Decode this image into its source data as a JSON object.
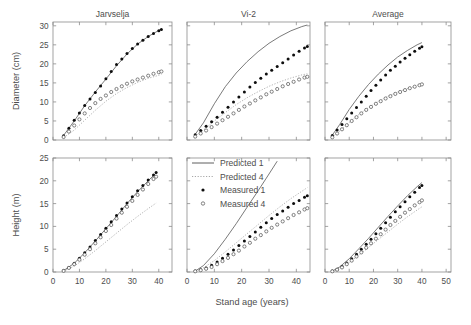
{
  "figure": {
    "xlabel": "Stand age (years)",
    "ylabel_top": "Diameter (cm)",
    "ylabel_bottom": "Height (m)"
  },
  "legend": {
    "items": [
      {
        "label": "Predicted 1",
        "key": "solid-line",
        "color": "#555555"
      },
      {
        "label": "Predicted 4",
        "key": "dotted-line",
        "color": "#999999"
      },
      {
        "label": "Measured 1",
        "key": "filled-circle",
        "color": "#111111"
      },
      {
        "label": "Measured 4",
        "key": "open-circle",
        "color": "#666666"
      }
    ]
  },
  "chart_data": [
    {
      "type": "line",
      "panel": "top-left",
      "title": "Jarvselja",
      "xlabel": "Stand age (years)",
      "ylabel": "Diameter (cm)",
      "xlim": [
        0,
        45
      ],
      "ylim": [
        0,
        31
      ],
      "xticks": [
        0,
        10,
        20,
        30,
        40
      ],
      "yticks": [
        0,
        5,
        10,
        15,
        20,
        25,
        30
      ],
      "grid": false,
      "series": [
        {
          "name": "Predicted 1",
          "style": "solid",
          "x": [
            4,
            8,
            12,
            16,
            20,
            24,
            28,
            32,
            36,
            40,
            41
          ],
          "y": [
            1.2,
            5.0,
            9.0,
            12.6,
            16.0,
            19.5,
            22.6,
            25.2,
            27.2,
            28.8,
            29.2
          ]
        },
        {
          "name": "Predicted 4",
          "style": "dotted",
          "x": [
            4,
            8,
            12,
            16,
            20,
            24,
            28,
            32,
            36,
            40,
            41
          ],
          "y": [
            0.6,
            2.6,
            5.2,
            7.8,
            10.2,
            12.2,
            13.8,
            15.1,
            16.2,
            17.0,
            17.2
          ]
        },
        {
          "name": "Measured 1",
          "style": "filled-dots",
          "x": [
            4,
            6,
            8,
            10,
            12,
            14,
            16,
            18,
            20,
            22,
            24,
            26,
            28,
            30,
            32,
            34,
            36,
            38,
            40,
            41
          ],
          "y": [
            1.1,
            3.1,
            5.2,
            7.1,
            9.1,
            10.8,
            12.5,
            14.2,
            16.1,
            18.0,
            19.8,
            21.3,
            22.7,
            24.0,
            25.2,
            26.2,
            27.2,
            28.0,
            28.7,
            29.0
          ]
        },
        {
          "name": "Measured 4",
          "style": "open-dots",
          "x": [
            4,
            6,
            8,
            10,
            12,
            14,
            16,
            18,
            20,
            22,
            24,
            26,
            28,
            30,
            32,
            34,
            36,
            38,
            40,
            41
          ],
          "y": [
            0.8,
            2.2,
            3.8,
            5.4,
            7.0,
            8.4,
            9.7,
            10.8,
            11.7,
            12.6,
            13.4,
            14.1,
            14.8,
            15.4,
            15.9,
            16.4,
            16.9,
            17.4,
            17.8,
            18.0
          ]
        }
      ]
    },
    {
      "type": "line",
      "panel": "top-middle",
      "title": "Vi-2",
      "xlabel": "Stand age (years)",
      "ylabel": "Diameter (cm)",
      "xlim": [
        0,
        45
      ],
      "ylim": [
        0,
        31
      ],
      "xticks": [
        0,
        10,
        20,
        30,
        40
      ],
      "yticks": [
        0,
        5,
        10,
        15,
        20,
        25,
        30
      ],
      "grid": false,
      "series": [
        {
          "name": "Predicted 1",
          "style": "solid",
          "x": [
            3,
            6,
            10,
            14,
            18,
            22,
            26,
            30,
            34,
            38,
            42,
            44
          ],
          "y": [
            1.5,
            4.5,
            9.5,
            14.0,
            17.6,
            20.6,
            23.2,
            25.4,
            27.2,
            28.7,
            29.8,
            30.2
          ]
        },
        {
          "name": "Predicted 4",
          "style": "dotted",
          "x": [
            3,
            6,
            10,
            14,
            18,
            22,
            26,
            30,
            34,
            38,
            42,
            44
          ],
          "y": [
            1.0,
            2.6,
            5.0,
            7.2,
            9.3,
            11.1,
            12.7,
            14.1,
            15.3,
            16.3,
            17.1,
            17.4
          ]
        },
        {
          "name": "Measured 1",
          "style": "filled-dots",
          "x": [
            3,
            5,
            7,
            9,
            11,
            13,
            15,
            17,
            19,
            21,
            23,
            25,
            27,
            29,
            31,
            33,
            35,
            37,
            39,
            41,
            43,
            44
          ],
          "y": [
            1.4,
            2.5,
            3.6,
            4.8,
            6.0,
            7.3,
            8.6,
            10.0,
            11.3,
            12.6,
            13.9,
            15.1,
            16.2,
            17.3,
            18.3,
            19.3,
            20.3,
            21.3,
            22.3,
            23.3,
            24.2,
            24.6
          ]
        },
        {
          "name": "Measured 4",
          "style": "open-dots",
          "x": [
            3,
            5,
            7,
            9,
            11,
            13,
            15,
            17,
            19,
            21,
            23,
            25,
            27,
            29,
            31,
            33,
            35,
            37,
            39,
            41,
            43,
            44
          ],
          "y": [
            0.9,
            1.7,
            2.5,
            3.4,
            4.3,
            5.2,
            6.1,
            7.0,
            7.9,
            8.8,
            9.6,
            10.4,
            11.2,
            12.0,
            12.7,
            13.4,
            14.1,
            14.7,
            15.3,
            15.9,
            16.4,
            16.6
          ]
        }
      ]
    },
    {
      "type": "line",
      "panel": "top-right",
      "title": "Average",
      "xlabel": "Stand age (years)",
      "ylabel": "Diameter (cm)",
      "xlim": [
        0,
        52
      ],
      "ylim": [
        0,
        31
      ],
      "xticks": [
        0,
        10,
        20,
        30,
        40,
        50
      ],
      "yticks": [
        0,
        5,
        10,
        15,
        20,
        25,
        30
      ],
      "grid": false,
      "series": [
        {
          "name": "Predicted 1",
          "style": "solid",
          "x": [
            3,
            6,
            10,
            14,
            18,
            22,
            26,
            30,
            34,
            38,
            40
          ],
          "y": [
            1.3,
            4.0,
            8.0,
            11.5,
            14.6,
            17.3,
            19.7,
            21.8,
            23.5,
            25.0,
            25.6
          ]
        },
        {
          "name": "Predicted 4",
          "style": "dotted",
          "x": [
            3,
            6,
            10,
            14,
            18,
            22,
            26,
            30,
            34,
            38,
            40
          ],
          "y": [
            0.8,
            2.3,
            4.6,
            6.7,
            8.5,
            10.1,
            11.5,
            12.6,
            13.5,
            14.3,
            14.6
          ]
        },
        {
          "name": "Measured 1",
          "style": "filled-dots",
          "x": [
            3,
            5,
            7,
            9,
            11,
            13,
            15,
            17,
            19,
            21,
            23,
            25,
            27,
            29,
            31,
            33,
            35,
            37,
            39,
            40
          ],
          "y": [
            1.2,
            2.6,
            4.1,
            5.6,
            7.1,
            8.5,
            10.0,
            11.5,
            13.0,
            14.4,
            15.8,
            17.1,
            18.3,
            19.4,
            20.5,
            21.5,
            22.4,
            23.3,
            24.1,
            24.5
          ]
        },
        {
          "name": "Measured 4",
          "style": "open-dots",
          "x": [
            3,
            5,
            7,
            9,
            11,
            13,
            15,
            17,
            19,
            21,
            23,
            25,
            27,
            29,
            31,
            33,
            35,
            37,
            39,
            40
          ],
          "y": [
            0.7,
            1.7,
            2.8,
            3.9,
            5.0,
            6.0,
            7.0,
            7.9,
            8.7,
            9.5,
            10.2,
            10.9,
            11.5,
            12.1,
            12.6,
            13.1,
            13.6,
            14.0,
            14.4,
            14.6
          ]
        }
      ]
    },
    {
      "type": "line",
      "panel": "bottom-left",
      "title": "Jarvselja",
      "xlabel": "Stand age (years)",
      "ylabel": "Height (m)",
      "xlim": [
        0,
        45
      ],
      "ylim": [
        0,
        25
      ],
      "xticks": [
        0,
        10,
        20,
        30,
        40
      ],
      "yticks": [
        0,
        5,
        10,
        15,
        20,
        25
      ],
      "grid": false,
      "series": [
        {
          "name": "Predicted 1",
          "style": "solid",
          "x": [
            4,
            8,
            12,
            16,
            20,
            24,
            28,
            32,
            36,
            39
          ],
          "y": [
            0.3,
            1.9,
            4.2,
            6.8,
            9.5,
            12.2,
            15.0,
            17.6,
            20.0,
            21.7
          ]
        },
        {
          "name": "Predicted 4",
          "style": "dotted",
          "x": [
            4,
            8,
            12,
            16,
            20,
            24,
            28,
            32,
            36,
            39
          ],
          "y": [
            0.2,
            1.3,
            2.9,
            4.7,
            6.6,
            8.5,
            10.4,
            12.2,
            13.9,
            15.1
          ]
        },
        {
          "name": "Measured 1",
          "style": "filled-dots",
          "x": [
            4,
            6,
            8,
            10,
            12,
            14,
            16,
            18,
            20,
            22,
            24,
            26,
            28,
            30,
            32,
            34,
            36,
            38,
            39
          ],
          "y": [
            0.3,
            1.0,
            1.9,
            3.0,
            4.2,
            5.5,
            6.9,
            8.2,
            9.6,
            11.0,
            12.4,
            13.8,
            15.1,
            16.5,
            17.8,
            19.0,
            20.2,
            21.3,
            21.8
          ]
        },
        {
          "name": "Measured 4",
          "style": "open-dots",
          "x": [
            4,
            6,
            8,
            10,
            12,
            14,
            16,
            18,
            20,
            22,
            24,
            26,
            28,
            30,
            32,
            34,
            36,
            38,
            39
          ],
          "y": [
            0.25,
            0.9,
            1.7,
            2.7,
            3.8,
            5.0,
            6.3,
            7.6,
            9.0,
            10.3,
            11.7,
            13.0,
            14.3,
            15.6,
            16.9,
            18.1,
            19.3,
            20.4,
            20.9
          ]
        }
      ]
    },
    {
      "type": "line",
      "panel": "bottom-middle",
      "title": "Vi-2",
      "xlabel": "Stand age (years)",
      "ylabel": "Height (m)",
      "xlim": [
        0,
        45
      ],
      "ylim": [
        0,
        25
      ],
      "xticks": [
        0,
        10,
        20,
        30,
        40
      ],
      "yticks": [
        0,
        5,
        10,
        15,
        20,
        25
      ],
      "grid": false,
      "series": [
        {
          "name": "Predicted 1",
          "style": "solid",
          "x": [
            3,
            6,
            10,
            14,
            18,
            22,
            26,
            30,
            33
          ],
          "y": [
            0.2,
            1.4,
            4.0,
            7.2,
            10.6,
            14.2,
            17.8,
            21.5,
            24.3
          ]
        },
        {
          "name": "Predicted 4",
          "style": "dotted",
          "x": [
            3,
            6,
            10,
            14,
            18,
            22,
            26,
            30,
            34,
            38,
            42,
            44
          ],
          "y": [
            0.15,
            0.9,
            2.5,
            4.4,
            6.4,
            8.4,
            10.4,
            12.4,
            14.3,
            16.1,
            17.7,
            18.5
          ]
        },
        {
          "name": "Measured 1",
          "style": "filled-dots",
          "x": [
            3,
            5,
            7,
            9,
            11,
            13,
            15,
            17,
            19,
            21,
            23,
            25,
            27,
            29,
            31,
            33,
            35,
            37,
            39,
            41,
            43,
            44
          ],
          "y": [
            0.2,
            0.5,
            0.9,
            1.5,
            2.2,
            3.0,
            3.9,
            4.8,
            5.8,
            6.8,
            7.8,
            8.8,
            9.8,
            10.8,
            11.7,
            12.6,
            13.4,
            14.2,
            15.0,
            15.7,
            16.4,
            16.7
          ]
        },
        {
          "name": "Measured 4",
          "style": "open-dots",
          "x": [
            3,
            5,
            7,
            9,
            11,
            13,
            15,
            17,
            19,
            21,
            23,
            25,
            27,
            29,
            31,
            33,
            35,
            37,
            39,
            41,
            43,
            44
          ],
          "y": [
            0.15,
            0.4,
            0.7,
            1.1,
            1.7,
            2.4,
            3.1,
            3.9,
            4.7,
            5.6,
            6.4,
            7.3,
            8.1,
            8.9,
            9.7,
            10.4,
            11.1,
            11.8,
            12.5,
            13.1,
            13.7,
            14.0
          ]
        }
      ]
    },
    {
      "type": "line",
      "panel": "bottom-right",
      "title": "Average",
      "xlabel": "Stand age (years)",
      "ylabel": "Height (m)",
      "xlim": [
        0,
        52
      ],
      "ylim": [
        0,
        25
      ],
      "xticks": [
        0,
        10,
        20,
        30,
        40,
        50
      ],
      "yticks": [
        0,
        5,
        10,
        15,
        20,
        25
      ],
      "grid": false,
      "series": [
        {
          "name": "Predicted 1",
          "style": "solid",
          "x": [
            3,
            6,
            10,
            14,
            18,
            22,
            26,
            30,
            34,
            38,
            40
          ],
          "y": [
            0.2,
            1.1,
            2.9,
            5.1,
            7.4,
            9.8,
            12.2,
            14.5,
            16.7,
            18.7,
            19.6
          ]
        },
        {
          "name": "Predicted 4",
          "style": "dotted",
          "x": [
            3,
            6,
            10,
            14,
            18,
            22,
            26,
            30,
            34,
            38,
            40
          ],
          "y": [
            0.15,
            0.8,
            2.1,
            3.7,
            5.4,
            7.1,
            8.8,
            10.5,
            12.1,
            13.6,
            14.3
          ]
        },
        {
          "name": "Measured 1",
          "style": "filled-dots",
          "x": [
            3,
            5,
            7,
            9,
            11,
            13,
            15,
            17,
            19,
            21,
            23,
            25,
            27,
            29,
            31,
            33,
            35,
            37,
            39,
            40
          ],
          "y": [
            0.2,
            0.6,
            1.2,
            2.0,
            2.9,
            3.9,
            5.0,
            6.1,
            7.2,
            8.4,
            9.6,
            10.8,
            12.0,
            13.2,
            14.3,
            15.4,
            16.5,
            17.5,
            18.5,
            19.0
          ]
        },
        {
          "name": "Measured 4",
          "style": "open-dots",
          "x": [
            3,
            5,
            7,
            9,
            11,
            13,
            15,
            17,
            19,
            21,
            23,
            25,
            27,
            29,
            31,
            33,
            35,
            37,
            39,
            40
          ],
          "y": [
            0.15,
            0.5,
            1.0,
            1.7,
            2.5,
            3.4,
            4.3,
            5.3,
            6.3,
            7.3,
            8.3,
            9.3,
            10.3,
            11.2,
            12.1,
            13.0,
            13.8,
            14.6,
            15.3,
            15.7
          ]
        }
      ]
    }
  ]
}
